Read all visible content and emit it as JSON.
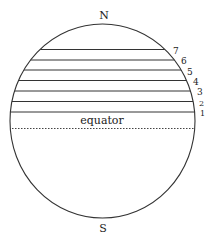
{
  "diagram": {
    "poles": {
      "north": "N",
      "south": "S"
    },
    "equator_label": "equator",
    "latitude_lines": [
      {
        "label": "1",
        "y": 112
      },
      {
        "label": "2",
        "y": 101.5
      },
      {
        "label": "3",
        "y": 91
      },
      {
        "label": "4",
        "y": 80.5
      },
      {
        "label": "5",
        "y": 70
      },
      {
        "label": "6",
        "y": 60
      },
      {
        "label": "7",
        "y": 49.5
      }
    ],
    "colors": {
      "line": "#333333",
      "background": "#ffffff"
    }
  }
}
